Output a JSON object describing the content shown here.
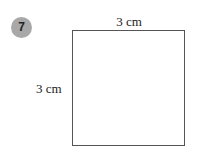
{
  "problem_number": "7",
  "shape": "square",
  "labels": {
    "top": "3 cm",
    "left": "3 cm"
  },
  "colors": {
    "badge": "#a8a8a8",
    "outline": "#555555"
  }
}
